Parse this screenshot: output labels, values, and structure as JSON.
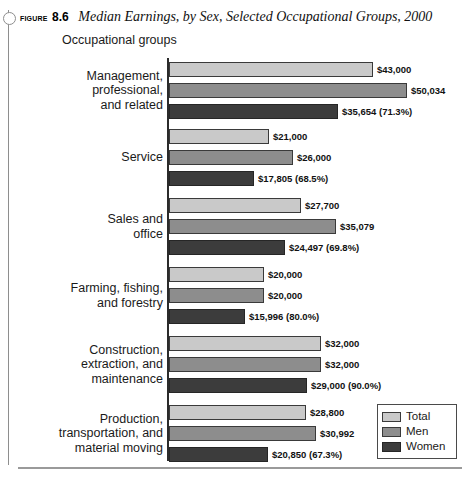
{
  "figure": {
    "label": "Figure",
    "number": "8.6",
    "title": "Median Earnings, by Sex, Selected Occupational Groups, 2000"
  },
  "axis_title": "Occupational groups",
  "legend": {
    "items": [
      {
        "label": "Total",
        "color": "#c9c9c9"
      },
      {
        "label": "Men",
        "color": "#8d8d8d"
      },
      {
        "label": "Women",
        "color": "#3c3c3c"
      }
    ]
  },
  "chart_data": {
    "type": "bar",
    "orientation": "horizontal",
    "title": "Median Earnings, by Sex, Selected Occupational Groups, 2000",
    "xlabel": "",
    "ylabel": "Occupational groups",
    "xlim": [
      0,
      50034
    ],
    "grid": false,
    "legend_position": "bottom-right",
    "categories": [
      "Management, professional, and related",
      "Service",
      "Sales and office",
      "Farming, fishing, and forestry",
      "Construction, extraction, and maintenance",
      "Production, transportation, and material moving"
    ],
    "category_lines": [
      "Management,\nprofessional,\nand related",
      "Service",
      "Sales and\noffice",
      "Farming, fishing,\nand forestry",
      "Construction,\nextraction, and\nmaintenance",
      "Production,\ntransportation, and\nmaterial moving"
    ],
    "series": [
      {
        "name": "Total",
        "values": [
          43000,
          21000,
          27700,
          20000,
          32000,
          28800
        ]
      },
      {
        "name": "Men",
        "values": [
          50034,
          26000,
          35079,
          20000,
          32000,
          30992
        ]
      },
      {
        "name": "Women",
        "values": [
          35654,
          17805,
          24497,
          15996,
          29000,
          20850
        ]
      }
    ],
    "women_ratio_pct": [
      71.3,
      68.5,
      69.8,
      80.0,
      90.0,
      67.3
    ],
    "labels": {
      "total": [
        "$43,000",
        "$21,000",
        "$27,700",
        "$20,000",
        "$32,000",
        "$28,800"
      ],
      "men": [
        "$50,034",
        "$26,000",
        "$35,079",
        "$20,000",
        "$32,000",
        "$30,992"
      ],
      "women": [
        "$35,654 (71.3%)",
        "$17,805 (68.5%)",
        "$24,497 (69.8%)",
        "$15,996 (80.0%)",
        "$29,000 (90.0%)",
        "$20,850 (67.3%)"
      ]
    }
  }
}
